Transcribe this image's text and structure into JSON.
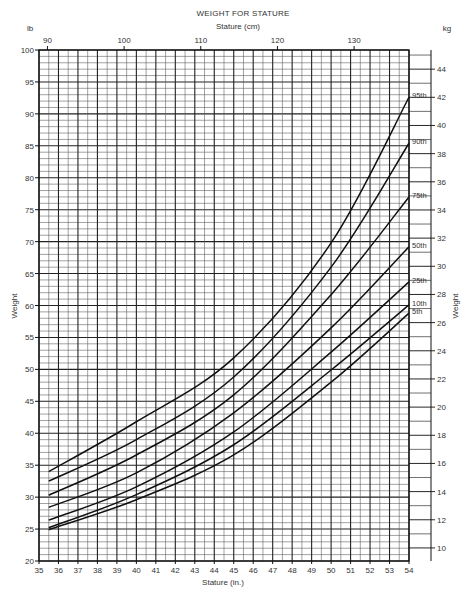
{
  "chart_data": {
    "type": "line",
    "title": "WEIGHT FOR STATURE",
    "top_axis_label": "Stature (cm)",
    "xlabel": "Stature (in.)",
    "ylabel": "Weight",
    "ylabel_right": "Weight",
    "left_unit": "lb",
    "right_unit": "kg",
    "xlim": [
      35,
      54
    ],
    "ylim": [
      20,
      100
    ],
    "x_ticks": [
      35,
      36,
      37,
      38,
      39,
      40,
      41,
      42,
      43,
      44,
      45,
      46,
      47,
      48,
      49,
      50,
      51,
      52,
      53,
      54
    ],
    "y_ticks": [
      20,
      25,
      30,
      35,
      40,
      45,
      50,
      55,
      60,
      65,
      70,
      75,
      80,
      85,
      90,
      95,
      100
    ],
    "cm_ticks": [
      90,
      100,
      110,
      120,
      130
    ],
    "kg_ticks": [
      10,
      12,
      14,
      16,
      18,
      20,
      22,
      24,
      26,
      28,
      30,
      32,
      34,
      36,
      38,
      40,
      42,
      44
    ],
    "grid": true,
    "legend_position": "inline-right",
    "x": [
      35.5,
      40,
      45,
      50,
      54
    ],
    "series": [
      {
        "name": "95th",
        "values": [
          34.0,
          41.8,
          51.8,
          69.8,
          92.6
        ]
      },
      {
        "name": "90th",
        "values": [
          32.5,
          39.0,
          48.8,
          66.0,
          85.4
        ]
      },
      {
        "name": "75th",
        "values": [
          30.3,
          36.6,
          46.0,
          61.7,
          77.0
        ]
      },
      {
        "name": "50th",
        "values": [
          28.4,
          33.8,
          43.2,
          56.5,
          69.2
        ]
      },
      {
        "name": "25th",
        "values": [
          26.4,
          31.6,
          40.2,
          52.7,
          63.7
        ]
      },
      {
        "name": "10th",
        "values": [
          25.2,
          30.4,
          38.2,
          49.9,
          60.1
        ]
      },
      {
        "name": "5th",
        "values": [
          24.9,
          29.6,
          36.6,
          48.0,
          58.8
        ]
      }
    ],
    "labels": {
      "title": "WEIGHT FOR STATURE",
      "cm": "Stature (cm)",
      "inches": "Stature (in.)",
      "weight_left": "Weight",
      "weight_right": "Weight",
      "lb": "lb",
      "kg": "kg"
    }
  }
}
